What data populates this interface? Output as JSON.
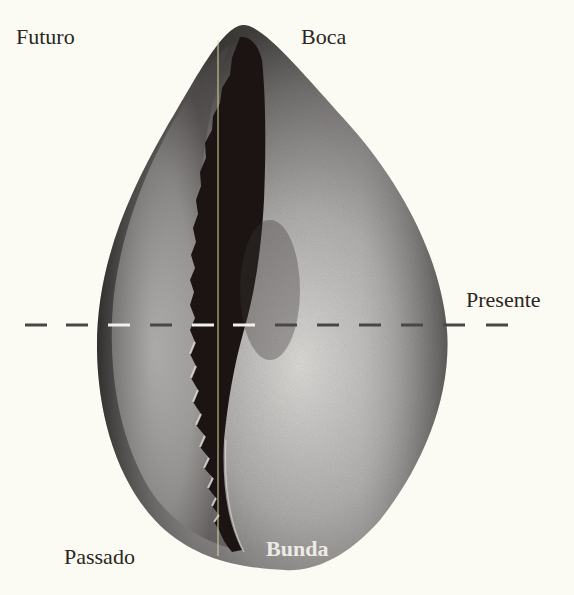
{
  "figure": {
    "background_color": "#fcfbf3",
    "labels": {
      "top_left": "Futuro",
      "top_right": "Boca",
      "middle_right": "Presente",
      "bottom_left": "Passado",
      "bottom_on_shell": "Bunda"
    },
    "annotations": {
      "dashed_line": "horizontal dashed line marking the present",
      "vertical_line": "thin vertical reference line through the shell opening"
    }
  }
}
